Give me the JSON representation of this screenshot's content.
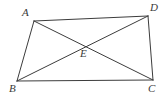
{
  "figure": {
    "type": "geometry-diagram",
    "width": 168,
    "height": 98,
    "background_color": "#ffffff",
    "stroke_color": "#3c3c3c",
    "stroke_width": 1,
    "label_color": "#3a3a3a",
    "points": {
      "A": {
        "label": "A",
        "x": 34,
        "y": 21,
        "label_x": 22,
        "label_y": 7
      },
      "B": {
        "label": "B",
        "x": 17,
        "y": 81,
        "label_x": 9,
        "label_y": 83
      },
      "C": {
        "label": "C",
        "x": 153,
        "y": 80,
        "label_x": 148,
        "label_y": 83
      },
      "D": {
        "label": "D",
        "x": 148,
        "y": 16,
        "label_x": 150,
        "label_y": 2
      },
      "E": {
        "label": "E",
        "x": 87,
        "y": 45,
        "label_x": 80,
        "label_y": 48
      }
    },
    "segments": [
      {
        "name": "side-AD",
        "from": "A",
        "to": "D"
      },
      {
        "name": "side-DC",
        "from": "D",
        "to": "C"
      },
      {
        "name": "side-CB",
        "from": "C",
        "to": "B"
      },
      {
        "name": "side-BA",
        "from": "B",
        "to": "A"
      },
      {
        "name": "diagonal-AC",
        "from": "A",
        "to": "C"
      },
      {
        "name": "diagonal-BD",
        "from": "B",
        "to": "D"
      }
    ]
  }
}
